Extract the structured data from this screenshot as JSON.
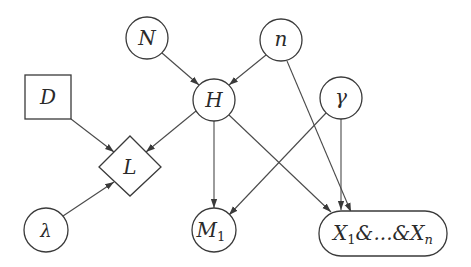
{
  "diagram": {
    "type": "directed-graph",
    "nodes": [
      {
        "id": "N",
        "label": "N",
        "shape": "circle"
      },
      {
        "id": "n",
        "label": "n",
        "shape": "circle"
      },
      {
        "id": "H",
        "label": "H",
        "shape": "circle"
      },
      {
        "id": "gamma",
        "label": "γ",
        "shape": "circle"
      },
      {
        "id": "D",
        "label": "D",
        "shape": "square"
      },
      {
        "id": "L",
        "label": "L",
        "shape": "diamond"
      },
      {
        "id": "lambda",
        "label": "λ",
        "shape": "circle"
      },
      {
        "id": "M1",
        "label": "M",
        "subscript": "1",
        "shape": "circle"
      },
      {
        "id": "X",
        "label_parts": [
          "X",
          "1",
          "&...&",
          "X",
          "n"
        ],
        "shape": "rounded-rect"
      }
    ],
    "edges": [
      {
        "from": "N",
        "to": "H"
      },
      {
        "from": "n",
        "to": "H"
      },
      {
        "from": "n",
        "to": "X"
      },
      {
        "from": "H",
        "to": "L"
      },
      {
        "from": "H",
        "to": "M1"
      },
      {
        "from": "H",
        "to": "X"
      },
      {
        "from": "gamma",
        "to": "M1"
      },
      {
        "from": "gamma",
        "to": "X"
      },
      {
        "from": "D",
        "to": "L"
      },
      {
        "from": "lambda",
        "to": "L"
      }
    ]
  }
}
